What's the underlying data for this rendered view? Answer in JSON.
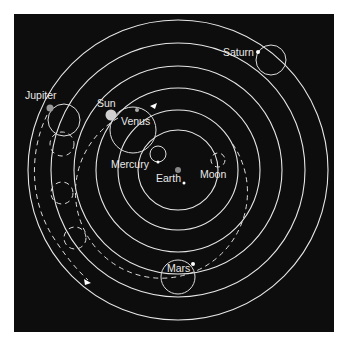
{
  "diagram": {
    "background": "#0d0d0d",
    "line_color": "#e6e6e6",
    "center": {
      "x": 178,
      "y": 170
    },
    "orbit_radii": [
      40,
      75,
      100,
      120,
      145,
      168
    ],
    "labels": {
      "earth": "Earth",
      "moon": "Moon",
      "mercury": "Mercury",
      "venus": "Venus",
      "sun": "Sun",
      "mars": "Mars",
      "jupiter": "Jupiter",
      "saturn": "Saturn"
    },
    "bodies": [
      {
        "name": "Earth",
        "x": 178,
        "y": 170,
        "r": 3,
        "color": "#888888"
      },
      {
        "name": "Sun",
        "x": 110,
        "y": 115,
        "r": 5.5,
        "color": "#cfcfcf"
      },
      {
        "name": "Jupiter",
        "x": 50,
        "y": 108,
        "r": 3.5,
        "color": "#999999"
      },
      {
        "name": "Venus",
        "x": 137,
        "y": 110,
        "r": 2,
        "color": "#aaaaaa"
      },
      {
        "name": "Saturn",
        "x": 258,
        "y": 52,
        "r": 2,
        "color": "#ffffff"
      },
      {
        "name": "Mars",
        "x": 193,
        "y": 264,
        "r": 2,
        "color": "#ffffff"
      }
    ],
    "epicycles": [
      {
        "name": "Saturn",
        "cx": 271,
        "cy": 60,
        "r": 15
      },
      {
        "name": "Jupiter",
        "cx": 64,
        "cy": 120,
        "r": 16
      },
      {
        "name": "Venus",
        "cx": 133,
        "cy": 130,
        "r": 22
      },
      {
        "name": "Mercury",
        "cx": 157,
        "cy": 153,
        "r": 8
      },
      {
        "name": "Mars",
        "cx": 178,
        "cy": 275,
        "r": 16
      },
      {
        "name": "Moon",
        "cx": 217,
        "cy": 160,
        "r": 7
      }
    ]
  }
}
